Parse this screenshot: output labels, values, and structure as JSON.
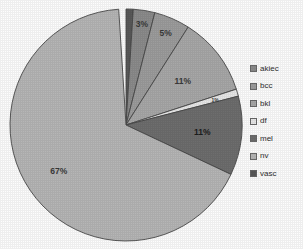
{
  "chart_data": {
    "type": "pie",
    "title": "",
    "subtitle": "",
    "xlabel": "",
    "ylabel": "",
    "legend_position": "right",
    "grid": false,
    "categories": [
      "akiec",
      "bcc",
      "bkl",
      "df",
      "mel",
      "nv",
      "vasc"
    ],
    "values": [
      3,
      5,
      11,
      1,
      11,
      67,
      1
    ],
    "labels": [
      "3%",
      "5%",
      "11%",
      "1%",
      "11%",
      "67%",
      "1%"
    ],
    "visible_labels": [
      "3%",
      "5%",
      "11%",
      "11%",
      "67%"
    ],
    "colors": [
      "#8c8c8c",
      "#9d9d9d",
      "#a8a8a8",
      "#e8e8e8",
      "#6e6e6e",
      "#b6b6b6",
      "#5a5a5a"
    ],
    "start_angle_deg": 0,
    "direction": "clockwise",
    "slices": [
      {
        "name": "vasc",
        "value": 1,
        "label": "",
        "color": "#5a5a5a",
        "start": 0,
        "end": 3.6,
        "label_visible": false
      },
      {
        "name": "akiec",
        "value": 3,
        "label": "3%",
        "color": "#8c8c8c",
        "start": 3.6,
        "end": 14.4,
        "label_visible": true
      },
      {
        "name": "bcc",
        "value": 5,
        "label": "5%",
        "color": "#9d9d9d",
        "start": 14.4,
        "end": 32.4,
        "label_visible": true
      },
      {
        "name": "bkl",
        "value": 11,
        "label": "11%",
        "color": "#a8a8a8",
        "start": 32.4,
        "end": 72.0,
        "label_visible": true
      },
      {
        "name": "df",
        "value": 1,
        "label": "1%",
        "color": "#e8e8e8",
        "start": 72.0,
        "end": 75.6,
        "label_visible": true
      },
      {
        "name": "mel",
        "value": 11,
        "label": "11%",
        "color": "#6e6e6e",
        "start": 75.6,
        "end": 115.2,
        "label_visible": true
      },
      {
        "name": "nv",
        "value": 67,
        "label": "67%",
        "color": "#b6b6b6",
        "start": 115.2,
        "end": 356.4,
        "label_visible": true
      }
    ]
  },
  "legend": {
    "items": [
      {
        "label": "akiec",
        "color": "#8c8c8c"
      },
      {
        "label": "bcc",
        "color": "#9d9d9d"
      },
      {
        "label": "bkl",
        "color": "#a8a8a8"
      },
      {
        "label": "df",
        "color": "#e8e8e8"
      },
      {
        "label": "mel",
        "color": "#6e6e6e"
      },
      {
        "label": "nv",
        "color": "#b6b6b6"
      },
      {
        "label": "vasc",
        "color": "#5a5a5a"
      }
    ]
  },
  "style": {
    "outline_color": "#4a4a4a",
    "background": "#fdfdfd",
    "label_color": "#2b2b2b"
  }
}
